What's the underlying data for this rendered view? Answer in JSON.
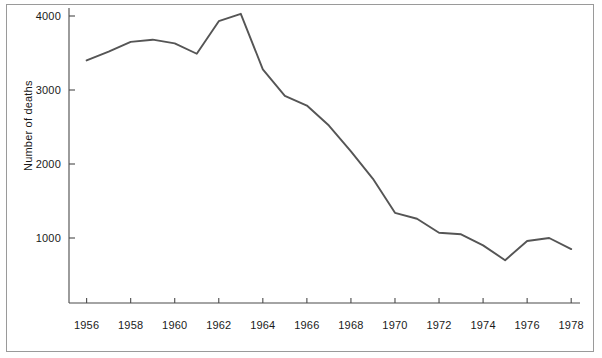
{
  "chart_data": {
    "type": "line",
    "title": "",
    "xlabel": "",
    "ylabel": "Number of deaths",
    "xlim": [
      1955.2,
      1978.4
    ],
    "ylim": [
      0,
      4200
    ],
    "grid": false,
    "legend": null,
    "xticks": [
      1956,
      1958,
      1960,
      1962,
      1964,
      1966,
      1968,
      1970,
      1972,
      1974,
      1976,
      1978
    ],
    "xtick_labels": [
      "1956",
      "1958",
      "1960",
      "1962",
      "1964",
      "1966",
      "1968",
      "1970",
      "1972",
      "1974",
      "1976",
      "1978"
    ],
    "yticks": [
      1000,
      2000,
      3000,
      4000
    ],
    "ytick_labels": [
      "1000",
      "2000",
      "3000",
      "4000"
    ],
    "series": [
      {
        "name": "Number of deaths",
        "color": "#555555",
        "x": [
          1956,
          1957,
          1958,
          1959,
          1960,
          1961,
          1962,
          1963,
          1964,
          1965,
          1966,
          1967,
          1968,
          1969,
          1970,
          1971,
          1972,
          1973,
          1974,
          1975,
          1976,
          1977,
          1978
        ],
        "values": [
          3400,
          3520,
          3650,
          3680,
          3630,
          3490,
          3930,
          4030,
          3280,
          2920,
          2790,
          2520,
          2170,
          1800,
          1340,
          1260,
          1070,
          1050,
          900,
          700,
          960,
          1000,
          850
        ]
      }
    ]
  },
  "axis": {
    "ylabel_text": "Number of deaths"
  }
}
